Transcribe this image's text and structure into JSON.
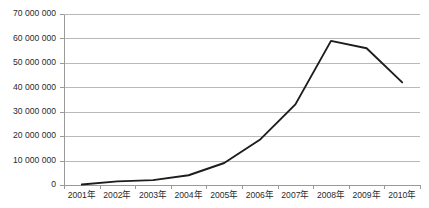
{
  "chart_data": {
    "type": "line",
    "title": "",
    "subtitle": "",
    "xlabel": "",
    "ylabel": "",
    "categories": [
      "2001年",
      "2002年",
      "2003年",
      "2004年",
      "2005年",
      "2006年",
      "2007年",
      "2008年",
      "2009年",
      "2010年"
    ],
    "values": [
      200000,
      1500000,
      2000000,
      4000000,
      9000000,
      18500000,
      33000000,
      59000000,
      56000000,
      42000000
    ],
    "series": [
      {
        "name": "",
        "values": [
          200000,
          1500000,
          2000000,
          4000000,
          9000000,
          18500000,
          33000000,
          59000000,
          56000000,
          42000000
        ]
      }
    ],
    "ylim": [
      0,
      70000000
    ],
    "ytick_values": [
      0,
      10000000,
      20000000,
      30000000,
      40000000,
      50000000,
      60000000,
      70000000
    ],
    "ytick_labels": [
      "0",
      "10 000 000",
      "20 000 000",
      "30 000 000",
      "40 000 000",
      "50 000 000",
      "60 000 000",
      "70 000 000"
    ],
    "xtick_labels": [
      "2001年",
      "2002年",
      "2003年",
      "2004年",
      "2005年",
      "2006年",
      "2007年",
      "2008年",
      "2009年",
      "2010年"
    ],
    "grid": true,
    "grid_axis": "y",
    "legend": false,
    "legend_position": "none",
    "annotations": [],
    "colors": {
      "line": "#1d1d1d",
      "gridline": "#b9b9b9",
      "axis": "#9a9a9a",
      "background": "#ffffff",
      "tick_text": "#2a2a2a"
    }
  },
  "layout": {
    "plot_left": 64,
    "plot_right": 420,
    "plot_top": 14,
    "plot_bottom": 185,
    "width": 429,
    "height": 208
  }
}
